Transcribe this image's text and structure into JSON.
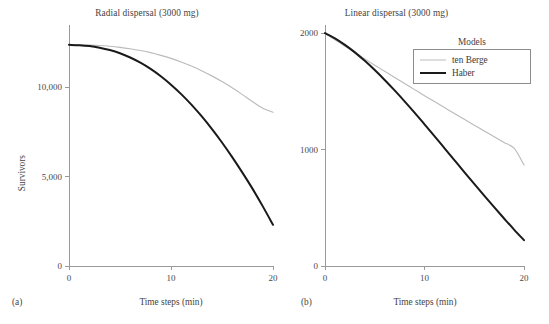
{
  "figure": {
    "subplot_labels": {
      "a": "(a)",
      "b": "(b)"
    }
  },
  "legend": {
    "title": "Models",
    "entries": [
      {
        "label": "ten Berge",
        "color": "#bbbbbb",
        "width": 1.2
      },
      {
        "label": "Haber",
        "color": "#1a1a1a",
        "width": 2.2
      }
    ]
  },
  "chart_data": [
    {
      "type": "line",
      "panel": "(a)",
      "title": "Radial dispersal (3000 mg)",
      "xlabel": "Time steps (min)",
      "ylabel": "Survivors",
      "xlim": [
        0,
        20
      ],
      "ylim": [
        0,
        13500
      ],
      "xticks": [
        0,
        10,
        20
      ],
      "xtick_labels": [
        "0",
        "10",
        "20"
      ],
      "yticks": [
        0,
        5000,
        10000
      ],
      "ytick_labels": [
        "0",
        "5,000",
        "10,000"
      ],
      "grid": false,
      "legend_position": "none",
      "x": [
        0,
        1,
        2,
        3,
        4,
        5,
        6,
        7,
        8,
        9,
        10,
        11,
        12,
        13,
        14,
        15,
        16,
        17,
        18,
        19,
        20
      ],
      "series": [
        {
          "name": "ten Berge",
          "color": "#bbbbbb",
          "values": [
            12390,
            12385,
            12375,
            12350,
            12310,
            12250,
            12170,
            12070,
            11950,
            11800,
            11630,
            11430,
            11200,
            10940,
            10650,
            10330,
            9980,
            9600,
            9200,
            8840,
            8610
          ]
        },
        {
          "name": "Haber",
          "color": "#1a1a1a",
          "values": [
            12390,
            12370,
            12320,
            12230,
            12100,
            11920,
            11680,
            11390,
            11040,
            10630,
            10160,
            9630,
            9040,
            8390,
            7680,
            6920,
            6100,
            5230,
            4320,
            3340,
            2310
          ]
        }
      ]
    },
    {
      "type": "line",
      "panel": "(b)",
      "title": "Linear dispersal (3000 mg)",
      "xlabel": "Time steps (min)",
      "ylabel": "",
      "xlim": [
        0,
        20
      ],
      "ylim": [
        0,
        2070
      ],
      "xticks": [
        0,
        10,
        20
      ],
      "xtick_labels": [
        "0",
        "10",
        "20"
      ],
      "yticks": [
        0,
        1000,
        2000
      ],
      "ytick_labels": [
        "0",
        "1000",
        "2000"
      ],
      "grid": false,
      "legend_position": "upper right",
      "x": [
        0,
        1,
        2,
        3,
        4,
        5,
        6,
        7,
        8,
        9,
        10,
        11,
        12,
        13,
        14,
        15,
        16,
        17,
        18,
        19,
        20
      ],
      "series": [
        {
          "name": "ten Berge",
          "color": "#bbbbbb",
          "values": [
            2000,
            1943,
            1888,
            1833,
            1779,
            1725,
            1672,
            1619,
            1567,
            1515,
            1463,
            1412,
            1361,
            1310,
            1260,
            1210,
            1160,
            1110,
            1060,
            1012,
            868
          ]
        },
        {
          "name": "Haber",
          "color": "#1a1a1a",
          "values": [
            2000,
            1955,
            1899,
            1835,
            1762,
            1683,
            1598,
            1508,
            1414,
            1317,
            1217,
            1116,
            1013,
            910,
            807,
            705,
            604,
            505,
            408,
            313,
            222
          ]
        }
      ]
    }
  ]
}
